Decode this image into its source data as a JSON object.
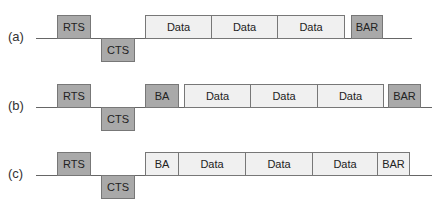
{
  "colors": {
    "control_frame": "#a9a9a9",
    "data_frame": "#f0f0f0",
    "line": "#666666"
  },
  "rows": [
    {
      "label": "(a)",
      "frames": [
        {
          "text": "RTS",
          "kind": "control",
          "side": "top"
        },
        {
          "text": "CTS",
          "kind": "control",
          "side": "bottom"
        },
        {
          "text": "Data",
          "kind": "data",
          "side": "top"
        },
        {
          "text": "Data",
          "kind": "data",
          "side": "top"
        },
        {
          "text": "Data",
          "kind": "data",
          "side": "top"
        },
        {
          "text": "BAR",
          "kind": "control",
          "side": "top"
        }
      ]
    },
    {
      "label": "(b)",
      "frames": [
        {
          "text": "RTS",
          "kind": "control",
          "side": "top"
        },
        {
          "text": "CTS",
          "kind": "control",
          "side": "bottom"
        },
        {
          "text": "BA",
          "kind": "control",
          "side": "top"
        },
        {
          "text": "Data",
          "kind": "data",
          "side": "top"
        },
        {
          "text": "Data",
          "kind": "data",
          "side": "top"
        },
        {
          "text": "Data",
          "kind": "data",
          "side": "top"
        },
        {
          "text": "BAR",
          "kind": "control",
          "side": "top"
        }
      ]
    },
    {
      "label": "(c)",
      "frames": [
        {
          "text": "RTS",
          "kind": "control",
          "side": "top"
        },
        {
          "text": "CTS",
          "kind": "control",
          "side": "bottom"
        },
        {
          "text": "BA",
          "kind": "data",
          "side": "top"
        },
        {
          "text": "Data",
          "kind": "data",
          "side": "top"
        },
        {
          "text": "Data",
          "kind": "data",
          "side": "top"
        },
        {
          "text": "Data",
          "kind": "data",
          "side": "top"
        },
        {
          "text": "BAR",
          "kind": "data",
          "side": "top"
        }
      ]
    }
  ]
}
